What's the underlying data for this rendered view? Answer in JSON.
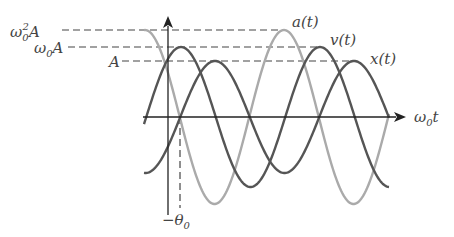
{
  "diagram": {
    "axes": {
      "x_label": "ω₀t",
      "x_label_main": "ω",
      "x_label_sub": "0",
      "x_label_tail": "t"
    },
    "levels": [
      {
        "name": "acceleration-amplitude",
        "label_main": "ω",
        "label_sub": "0",
        "label_sup": "2",
        "label_tail": "A",
        "y": 30
      },
      {
        "name": "velocity-amplitude",
        "label_main": "ω",
        "label_sub": "0",
        "label_sup": "",
        "label_tail": "A",
        "y": 47
      },
      {
        "name": "position-amplitude",
        "label_main": "",
        "label_sub": "",
        "label_sup": "",
        "label_tail": "A",
        "y": 61
      }
    ],
    "curves": [
      {
        "name": "x(t)",
        "label": "x(t)",
        "color": "#555555",
        "amplitude_px": 56,
        "phase_peak_x": 215
      },
      {
        "name": "v(t)",
        "label": "v(t)",
        "color": "#555555",
        "amplitude_px": 70,
        "phase_peak_x": 181
      },
      {
        "name": "a(t)",
        "label": "a(t)",
        "color": "#aaaaaa",
        "amplitude_px": 87,
        "phase_peak_x": 284
      }
    ],
    "phase_marker": {
      "label_minus": "−",
      "label_main": "θ",
      "label_sub": "0",
      "x": 180
    },
    "colors": {
      "axis": "#222222",
      "dashed": "#444444",
      "dark_curve": "#555555",
      "light_curve": "#aaaaaa"
    }
  }
}
